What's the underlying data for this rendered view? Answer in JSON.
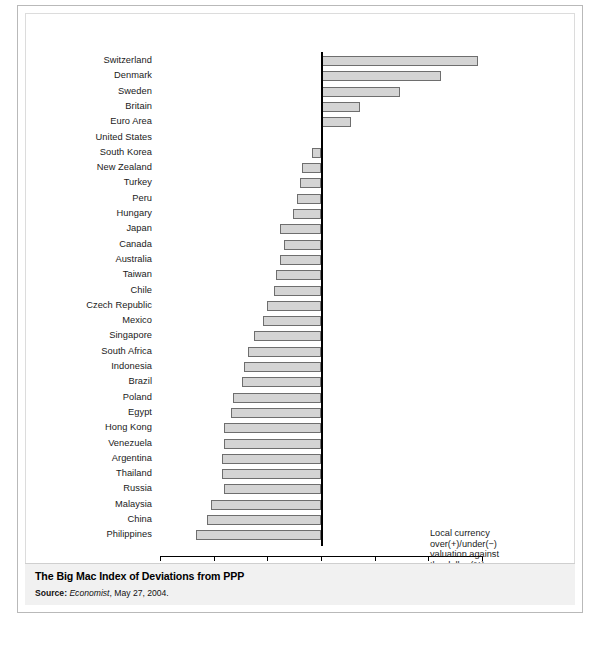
{
  "caption": {
    "title": "The Big Mac Index of Deviations from PPP",
    "source_label": "Source:",
    "source_italic": "Economist",
    "source_rest": ", May 27, 2004."
  },
  "legend": {
    "line1": "Local currency",
    "line2": "over(+)/under(−)",
    "line3": "valuation against",
    "line4": "the dollar (%)"
  },
  "chart_data": {
    "type": "bar",
    "orientation": "horizontal",
    "title": "The Big Mac Index of Deviations from PPP",
    "xlabel": "Local currency over(+)/under(−) valuation against the dollar (%)",
    "ylabel": "",
    "xlim": [
      -75,
      75
    ],
    "xticks": [
      -75,
      -50,
      -25,
      0,
      25,
      50,
      75
    ],
    "xticklabels": [
      "–75",
      "–50",
      "–25",
      "0",
      "25",
      "50",
      "75"
    ],
    "grid": false,
    "legend": "none",
    "bar_fill": "#d4d4d4",
    "bar_edge": "#6e6e6e",
    "categories": [
      "Switzerland",
      "Denmark",
      "Sweden",
      "Britain",
      "Euro Area",
      "United States",
      "South Korea",
      "New Zealand",
      "Turkey",
      "Peru",
      "Hungary",
      "Japan",
      "Canada",
      "Australia",
      "Taiwan",
      "Chile",
      "Czech Republic",
      "Mexico",
      "Singapore",
      "South Africa",
      "Indonesia",
      "Brazil",
      "Poland",
      "Egypt",
      "Hong Kong",
      "Venezuela",
      "Argentina",
      "Thailand",
      "Russia",
      "Malaysia",
      "China",
      "Philippines"
    ],
    "values": [
      73,
      56,
      37,
      18,
      14,
      0,
      -4,
      -9,
      -10,
      -11,
      -13,
      -19,
      -17,
      -19,
      -21,
      -22,
      -25,
      -27,
      -31,
      -34,
      -36,
      -37,
      -41,
      -42,
      -45,
      -45,
      -46,
      -46,
      -45,
      -51,
      -53,
      -58
    ]
  }
}
